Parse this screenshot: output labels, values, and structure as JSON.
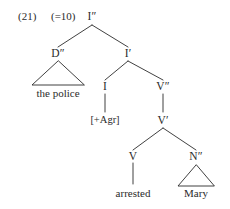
{
  "figure": {
    "example_number": "(21)",
    "example_reference": "(=10)",
    "ink_color": "#2b2b2b",
    "background_color": "#ffffff"
  },
  "tree": {
    "root_label": "I″",
    "nodes": {
      "ip": "I″",
      "dp": "D″",
      "ibar": "I′",
      "i": "I",
      "vp": "V″",
      "vbar": "V′",
      "v": "V",
      "np": "N″"
    },
    "terminals": {
      "subject": "the police",
      "agr": "[+Agr]",
      "verb": "arrested",
      "object": "Mary"
    }
  }
}
